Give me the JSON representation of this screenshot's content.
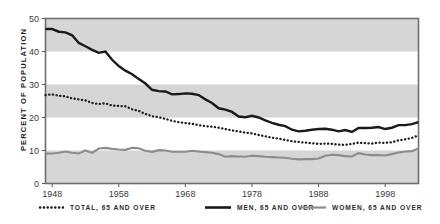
{
  "chart_data": {
    "type": "line",
    "title": "",
    "xlabel": "",
    "ylabel": "PERCENT OF POPULATION",
    "xlim": [
      1947,
      2003
    ],
    "ylim": [
      0,
      50
    ],
    "ytick_labels": [
      "0",
      "10",
      "20",
      "30",
      "40",
      "50"
    ],
    "ytick_values": [
      0,
      10,
      20,
      30,
      40,
      50
    ],
    "xtick_labels": [
      "1948",
      "1958",
      "1968",
      "1978",
      "1988",
      "1998"
    ],
    "xtick_values": [
      1948,
      1958,
      1968,
      1978,
      1988,
      1998
    ],
    "grid": false,
    "banded_background": true,
    "band_color": "#d6d6d6",
    "legend_position": "bottom",
    "x": [
      1947,
      1948,
      1949,
      1950,
      1951,
      1952,
      1953,
      1954,
      1955,
      1956,
      1957,
      1958,
      1959,
      1960,
      1961,
      1962,
      1963,
      1964,
      1965,
      1966,
      1967,
      1968,
      1969,
      1970,
      1971,
      1972,
      1973,
      1974,
      1975,
      1976,
      1977,
      1978,
      1979,
      1980,
      1981,
      1982,
      1983,
      1984,
      1985,
      1986,
      1987,
      1988,
      1989,
      1990,
      1991,
      1992,
      1993,
      1994,
      1995,
      1996,
      1997,
      1998,
      1999,
      2000,
      2001,
      2002,
      2003
    ],
    "series": [
      {
        "name": "TOTAL, 65 AND OVER",
        "style": "dotted",
        "color": "#1a1a1a",
        "values": [
          26.8,
          27.0,
          26.6,
          26.4,
          25.8,
          25.5,
          25.2,
          24.4,
          24.1,
          24.3,
          23.6,
          23.5,
          23.4,
          22.5,
          22.0,
          21.1,
          20.4,
          20.1,
          19.6,
          19.0,
          18.6,
          18.3,
          18.1,
          17.7,
          17.4,
          17.2,
          16.9,
          16.5,
          16.1,
          15.8,
          15.4,
          15.2,
          14.7,
          14.3,
          13.9,
          13.6,
          13.2,
          12.8,
          12.6,
          12.4,
          12.2,
          12.0,
          12.1,
          12.0,
          11.8,
          11.7,
          12.0,
          12.4,
          12.2,
          12.1,
          12.4,
          12.3,
          12.5,
          13.1,
          13.4,
          13.8,
          14.6
        ]
      },
      {
        "name": "MEN, 65 AND OVER",
        "style": "solid",
        "color": "#1a1a1a",
        "values": [
          46.8,
          46.8,
          46.0,
          45.8,
          44.9,
          42.6,
          41.6,
          40.5,
          39.6,
          40.0,
          37.5,
          35.6,
          34.2,
          33.1,
          31.7,
          30.3,
          28.4,
          28.0,
          27.9,
          27.0,
          27.1,
          27.3,
          27.2,
          26.8,
          25.5,
          24.4,
          22.8,
          22.4,
          21.7,
          20.3,
          20.1,
          20.5,
          20.0,
          19.1,
          18.4,
          17.8,
          17.4,
          16.3,
          15.8,
          16.0,
          16.3,
          16.5,
          16.6,
          16.3,
          15.8,
          16.2,
          15.6,
          16.8,
          16.8,
          16.9,
          17.1,
          16.5,
          16.9,
          17.7,
          17.7,
          18.0,
          18.6
        ]
      },
      {
        "name": "WOMEN, 65 AND OVER",
        "style": "solid-gray",
        "color": "#8c8c8c",
        "values": [
          9.1,
          9.1,
          9.3,
          9.7,
          9.3,
          9.1,
          10.0,
          9.3,
          10.6,
          10.8,
          10.5,
          10.3,
          10.2,
          10.8,
          10.7,
          9.9,
          9.6,
          10.1,
          10.0,
          9.6,
          9.6,
          9.6,
          9.9,
          9.7,
          9.5,
          9.3,
          8.9,
          8.1,
          8.3,
          8.2,
          8.1,
          8.4,
          8.3,
          8.1,
          8.0,
          7.9,
          7.8,
          7.5,
          7.3,
          7.4,
          7.4,
          7.6,
          8.4,
          8.7,
          8.6,
          8.3,
          8.2,
          9.2,
          8.8,
          8.6,
          8.6,
          8.5,
          8.9,
          9.4,
          9.7,
          9.8,
          10.6
        ]
      }
    ],
    "legend": [
      {
        "label": "TOTAL, 65 AND OVER",
        "style": "dotted",
        "color": "#1a1a1a"
      },
      {
        "label": "MEN, 65 AND OVER",
        "style": "solid",
        "color": "#1a1a1a"
      },
      {
        "label": "WOMEN, 65 AND OVER",
        "style": "solid-gray",
        "color": "#8c8c8c"
      }
    ]
  }
}
